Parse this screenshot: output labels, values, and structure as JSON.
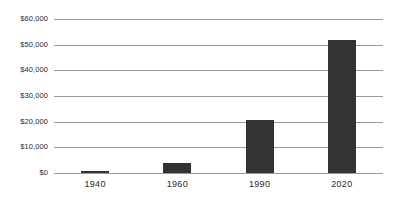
{
  "chart_data": {
    "type": "bar",
    "title": "",
    "xlabel": "",
    "ylabel": "",
    "categories": [
      "1940",
      "1960",
      "1990",
      "2020"
    ],
    "values": [
      700,
      3900,
      20800,
      52000
    ],
    "series": [
      {
        "name": "Value",
        "values": [
          700,
          3900,
          20800,
          52000
        ]
      }
    ],
    "ylim": [
      0,
      60000
    ],
    "ytick_values": [
      0,
      10000,
      20000,
      30000,
      40000,
      50000,
      60000
    ],
    "ytick_labels": [
      "$0",
      "$10,000",
      "$20,000",
      "$30,000",
      "$40,000",
      "$50,000",
      "$60,000"
    ],
    "xtick_labels": [
      "1940",
      "1960",
      "1990",
      "2020"
    ],
    "grid": true,
    "grid_axis": "y",
    "legend": false,
    "legend_position": "none",
    "bar_color": "#333333",
    "gridline_color": "#9a9a9a",
    "background_color": "#ffffff",
    "text_color": "#2b2b2b"
  }
}
